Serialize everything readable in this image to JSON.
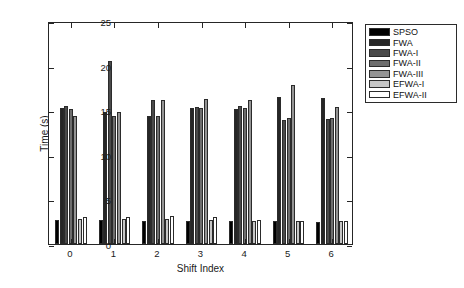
{
  "figure": {
    "background": "#ffffff",
    "axis_color": "#262626"
  },
  "axes": {
    "y_title": "Time (s)",
    "x_title": "Shift Index",
    "y_ticks": [
      "0",
      "5",
      "10",
      "15",
      "20",
      "25"
    ],
    "x_ticks": [
      "0",
      "1",
      "2",
      "3",
      "4",
      "5",
      "6"
    ]
  },
  "legend": {
    "entries": [
      {
        "label": "SPSO",
        "color": "#000000"
      },
      {
        "label": "FWA",
        "color": "#262626"
      },
      {
        "label": "FWA-I",
        "color": "#4a4a4a"
      },
      {
        "label": "FWA-II",
        "color": "#6e6e6e"
      },
      {
        "label": "FWA-III",
        "color": "#949494"
      },
      {
        "label": "EFWA-I",
        "color": "#c6c6c6"
      },
      {
        "label": "EFWA-II",
        "color": "#ffffff"
      }
    ]
  },
  "chart_data": {
    "type": "bar",
    "title": "",
    "xlabel": "Shift Index",
    "ylabel": "Time (s)",
    "ylim": [
      0,
      25
    ],
    "ytick_step": 5,
    "grid": false,
    "legend_position": "outside-right-top",
    "categories": [
      "0",
      "1",
      "2",
      "3",
      "4",
      "5",
      "6"
    ],
    "series": [
      {
        "name": "SPSO",
        "color": "#000000",
        "values": [
          2.7,
          2.7,
          2.6,
          2.6,
          2.6,
          2.6,
          2.5
        ]
      },
      {
        "name": "FWA",
        "color": "#262626",
        "values": [
          15.3,
          14.8,
          14.4,
          15.2,
          15.1,
          16.5,
          16.4
        ]
      },
      {
        "name": "FWA-I",
        "color": "#4a4a4a",
        "values": [
          15.5,
          20.5,
          16.2,
          15.4,
          15.5,
          13.9,
          14.0
        ]
      },
      {
        "name": "FWA-II",
        "color": "#6e6e6e",
        "values": [
          15.1,
          14.3,
          14.3,
          15.2,
          15.2,
          14.1,
          14.1
        ]
      },
      {
        "name": "FWA-III",
        "color": "#949494",
        "values": [
          14.3,
          14.8,
          16.1,
          16.3,
          16.1,
          17.8,
          15.4
        ]
      },
      {
        "name": "EFWA-I",
        "color": "#c6c6c6",
        "values": [
          2.8,
          2.8,
          2.8,
          2.7,
          2.6,
          2.6,
          2.6
        ]
      },
      {
        "name": "EFWA-II",
        "color": "#ffffff",
        "values": [
          3.0,
          3.0,
          3.1,
          3.0,
          2.7,
          2.6,
          2.6
        ]
      }
    ]
  }
}
